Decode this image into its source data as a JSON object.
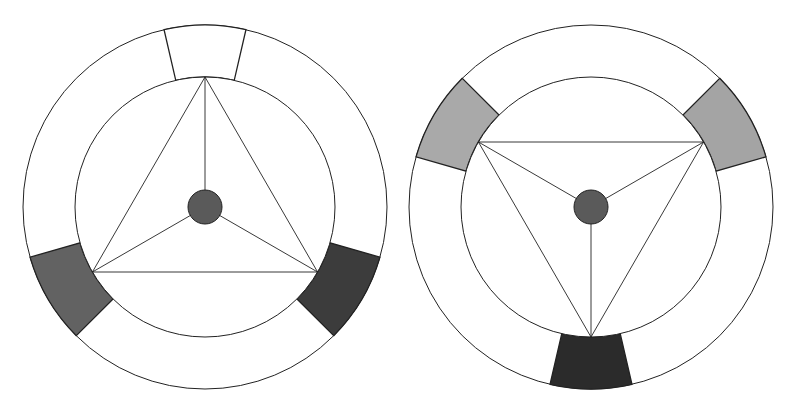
{
  "diagram": {
    "type": "color-wheel-triad-comparison",
    "stroke_color": "#222222",
    "background": "#ffffff",
    "wheels": [
      {
        "id": "left-wheel",
        "center": [
          205,
          207
        ],
        "outer_radius": 182,
        "inner_radius": 130,
        "dot_radius": 17,
        "dot_color": "#5a5a5a",
        "triangle_orientation": "point-up",
        "triangle_vertices_deg": [
          -90,
          150,
          30
        ],
        "segments": [
          {
            "name": "top-segment",
            "start_deg": -103,
            "end_deg": -77,
            "fill": "#ffffff"
          },
          {
            "name": "bottom-left-segment",
            "start_deg": 135,
            "end_deg": 164,
            "fill": "#626262"
          },
          {
            "name": "bottom-right-segment",
            "start_deg": 16,
            "end_deg": 45,
            "fill": "#3c3c3c"
          }
        ]
      },
      {
        "id": "right-wheel",
        "center": [
          591,
          207
        ],
        "outer_radius": 182,
        "inner_radius": 130,
        "dot_radius": 17,
        "dot_color": "#5a5a5a",
        "triangle_orientation": "point-down",
        "triangle_vertices_deg": [
          90,
          -150,
          -30
        ],
        "segments": [
          {
            "name": "top-left-segment",
            "start_deg": -164,
            "end_deg": -135,
            "fill": "#a9a9a9"
          },
          {
            "name": "top-right-segment",
            "start_deg": -45,
            "end_deg": -16,
            "fill": "#a4a4a4"
          },
          {
            "name": "bottom-segment",
            "start_deg": 77,
            "end_deg": 103,
            "fill": "#2b2b2b"
          }
        ]
      }
    ]
  }
}
